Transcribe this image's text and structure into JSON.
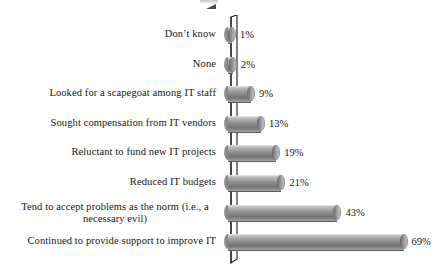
{
  "chart_data": {
    "type": "bar",
    "orientation": "horizontal",
    "title": "",
    "subtitle": "",
    "xlabel": "",
    "ylabel": "",
    "xlim": [
      0,
      69
    ],
    "grid": false,
    "legend": null,
    "value_suffix": "%",
    "categories": [
      "Don’t know",
      "None",
      "Looked for a scapegoat among IT staff",
      "Sought compensation from IT vendors",
      "Reluctant to fund new IT projects",
      "Reduced IT budgets",
      "Tend to accept problems as the norm (i.e., a necessary evil)",
      "Continued to provide support to improve IT"
    ],
    "values": [
      1,
      2,
      9,
      13,
      19,
      21,
      43,
      69
    ],
    "value_labels": [
      "1%",
      "2%",
      "9%",
      "13%",
      "19%",
      "21%",
      "43%",
      "69%"
    ],
    "colors": {
      "bar_light": "#cfcfcf",
      "bar_mid": "#8f8f8f",
      "bar_dark": "#757575",
      "axis": "#1a1a1a",
      "text": "#161616",
      "background": "#ffffff"
    }
  },
  "rows": [
    {
      "label": "Don’t know",
      "value_label": "1%",
      "two_line": false,
      "line1": "Don’t know",
      "line2": ""
    },
    {
      "label": "None",
      "value_label": "2%",
      "two_line": false,
      "line1": "None",
      "line2": ""
    },
    {
      "label": "Looked for a scapegoat among IT staff",
      "value_label": "9%",
      "two_line": false,
      "line1": "Looked for a scapegoat among IT staff",
      "line2": ""
    },
    {
      "label": "Sought compensation from IT vendors",
      "value_label": "13%",
      "two_line": false,
      "line1": "Sought compensation from IT vendors",
      "line2": ""
    },
    {
      "label": "Reluctant to fund new IT projects",
      "value_label": "19%",
      "two_line": false,
      "line1": "Reluctant to fund new IT projects",
      "line2": ""
    },
    {
      "label": "Reduced IT budgets",
      "value_label": "21%",
      "two_line": false,
      "line1": "Reduced IT budgets",
      "line2": ""
    },
    {
      "label": "Tend to accept problems as the norm (i.e., a necessary evil)",
      "value_label": "43%",
      "two_line": true,
      "line1": "Tend to accept problems as the norm (i.e., a",
      "line2": "necessary evil)"
    },
    {
      "label": "Continued to provide support to improve IT",
      "value_label": "69%",
      "two_line": false,
      "line1": "Continued to provide support to improve IT",
      "line2": ""
    }
  ]
}
